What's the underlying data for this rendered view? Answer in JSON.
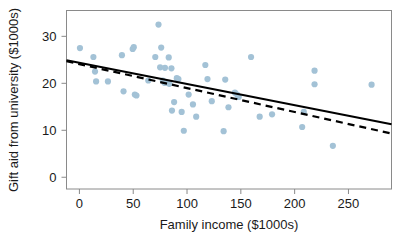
{
  "chart_data": {
    "type": "scatter",
    "title": "",
    "xlabel": "Family income ($1000s)",
    "ylabel": "Gift aid from university ($1000s)",
    "xlim": [
      -12,
      290
    ],
    "ylim": [
      -2.5,
      35.5
    ],
    "xticks": [
      0,
      50,
      100,
      150,
      200,
      250
    ],
    "xticklabels": [
      "0",
      "50",
      "100",
      "150",
      "200",
      "250"
    ],
    "yticks": [
      0,
      10,
      20,
      30
    ],
    "yticklabels": [
      "0",
      "10",
      "20",
      "30"
    ],
    "grid": false,
    "legend": "none",
    "point_color": "#a3c2d6",
    "line_color": "#000000",
    "frame_color": "#808080",
    "series": [
      {
        "name": "students",
        "marker": "circle",
        "points": [
          [
            0.5,
            27.5
          ],
          [
            13.0,
            25.6
          ],
          [
            14.5,
            22.5
          ],
          [
            15.5,
            20.4
          ],
          [
            26.5,
            20.4
          ],
          [
            39.5,
            26.0
          ],
          [
            41.0,
            18.3
          ],
          [
            49.5,
            27.3
          ],
          [
            50.5,
            27.7
          ],
          [
            51.5,
            17.6
          ],
          [
            53.0,
            17.4
          ],
          [
            64.0,
            20.6
          ],
          [
            70.5,
            25.6
          ],
          [
            73.5,
            32.5
          ],
          [
            75.0,
            23.4
          ],
          [
            76.0,
            27.6
          ],
          [
            77.5,
            20.6
          ],
          [
            79.0,
            20.1
          ],
          [
            79.5,
            23.3
          ],
          [
            81.5,
            20.1
          ],
          [
            83.0,
            25.5
          ],
          [
            83.5,
            19.9
          ],
          [
            85.5,
            23.2
          ],
          [
            86.0,
            14.2
          ],
          [
            88.0,
            16.0
          ],
          [
            90.5,
            21.1
          ],
          [
            92.0,
            20.9
          ],
          [
            95.0,
            13.9
          ],
          [
            97.0,
            9.9
          ],
          [
            101.5,
            17.6
          ],
          [
            105.5,
            15.5
          ],
          [
            108.5,
            12.9
          ],
          [
            117.0,
            23.9
          ],
          [
            119.0,
            20.9
          ],
          [
            123.0,
            16.2
          ],
          [
            134.0,
            9.8
          ],
          [
            135.5,
            20.8
          ],
          [
            138.5,
            14.9
          ],
          [
            144.5,
            18.0
          ],
          [
            146.5,
            17.6
          ],
          [
            148.0,
            17.1
          ],
          [
            159.5,
            25.6
          ],
          [
            167.5,
            12.9
          ],
          [
            179.0,
            13.4
          ],
          [
            207.0,
            10.7
          ],
          [
            208.5,
            13.9
          ],
          [
            218.5,
            22.7
          ],
          [
            218.5,
            19.8
          ],
          [
            235.5,
            6.7
          ],
          [
            271.5,
            19.7
          ]
        ]
      }
    ],
    "trend_lines": [
      {
        "name": "least-squares-fit-solid",
        "style": "solid",
        "x_start": -12,
        "y_start": 24.9,
        "x_end": 290,
        "y_end": 11.3
      },
      {
        "name": "alternative-fit-dashed",
        "style": "dashed",
        "x_start": -12,
        "y_start": 24.7,
        "x_end": 290,
        "y_end": 9.3
      }
    ]
  }
}
